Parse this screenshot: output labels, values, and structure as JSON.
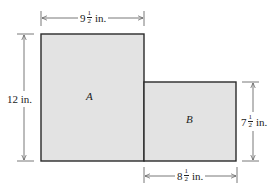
{
  "diagram": {
    "type": "composite-rectangle-area",
    "fill_color": "#e3e3e3",
    "stroke_color": "#2a2a2a",
    "dimension_line_color": "#555555",
    "regions": [
      {
        "id": "A",
        "label": "A"
      },
      {
        "id": "B",
        "label": "B"
      }
    ],
    "dimensions": {
      "top": {
        "whole": "9",
        "num": "1",
        "den": "2",
        "unit": "in."
      },
      "left": {
        "text": "12 in."
      },
      "right": {
        "whole": "7",
        "num": "1",
        "den": "2",
        "unit": "in."
      },
      "bottom": {
        "whole": "8",
        "num": "1",
        "den": "2",
        "unit": "in."
      }
    }
  }
}
